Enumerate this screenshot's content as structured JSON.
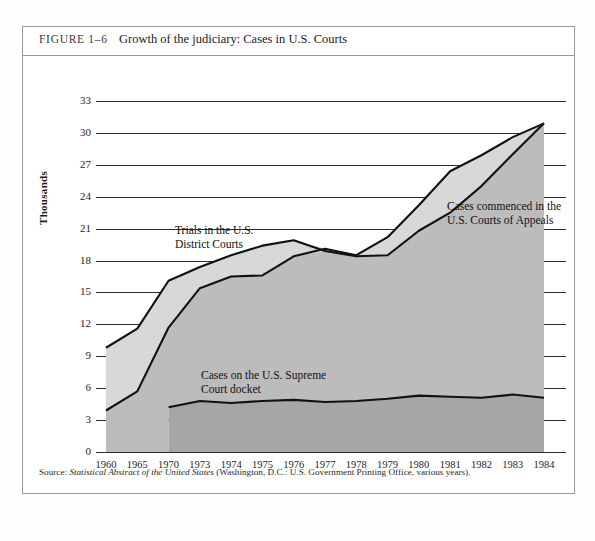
{
  "figure": {
    "label": "FIGURE 1–6",
    "title": "Growth of the judiciary: Cases in U.S. Courts",
    "source_prefix": "Source: ",
    "source_italic": "Statistical Abstract of the United States",
    "source_rest": " (Washington, D.C.: U.S. Government Printing Office, various years)."
  },
  "annotations": {
    "appeals": "Cases commenced in the\nU.S. Courts of Appeals",
    "appeals_line1": "Cases commenced in the",
    "appeals_line2": "U.S. Courts of Appeals",
    "district_line1": "Trials in the U.S.",
    "district_line2": "District Courts",
    "supreme_line1": "Cases on the U.S. Supreme",
    "supreme_line2": "Court docket"
  },
  "colors": {
    "band_upper": "#d8d8d8",
    "band_middle": "#bcbcbc",
    "band_lower": "#a6a6a6",
    "line": "#111111",
    "grid": "#2d2d2d",
    "border": "#9a9a9a"
  },
  "chart_data": {
    "type": "area",
    "title": "Growth of the judiciary: Cases in U.S. Courts",
    "xlabel": "Years",
    "ylabel": "Thousands",
    "ylim": [
      0,
      33
    ],
    "yticks": [
      0,
      3,
      6,
      9,
      12,
      15,
      18,
      21,
      24,
      27,
      30,
      33
    ],
    "grid": true,
    "legend": "annotations-inline",
    "categories": [
      "1960",
      "1965",
      "1970",
      "1973",
      "1974",
      "1975",
      "1976",
      "1977",
      "1978",
      "1979",
      "1980",
      "1981",
      "1982",
      "1983",
      "1984"
    ],
    "series": [
      {
        "name": "Trials in the U.S. District Courts",
        "values": [
          9.8,
          11.6,
          16.1,
          17.4,
          18.5,
          19.4,
          19.9,
          18.9,
          18.4,
          18.5,
          20.8,
          22.5,
          25.0,
          28.0,
          30.9
        ]
      },
      {
        "name": "Cases commenced in the U.S. Courts of Appeals",
        "values": [
          3.9,
          5.7,
          11.7,
          15.4,
          16.5,
          16.6,
          18.4,
          19.1,
          18.5,
          20.2,
          23.2,
          26.4,
          27.9,
          29.6,
          30.9
        ]
      },
      {
        "name": "Cases on the U.S. Supreme Court docket",
        "values": [
          null,
          null,
          4.2,
          4.8,
          4.6,
          4.8,
          4.9,
          4.7,
          4.8,
          5.0,
          5.3,
          5.2,
          5.1,
          5.4,
          5.1
        ]
      }
    ]
  }
}
